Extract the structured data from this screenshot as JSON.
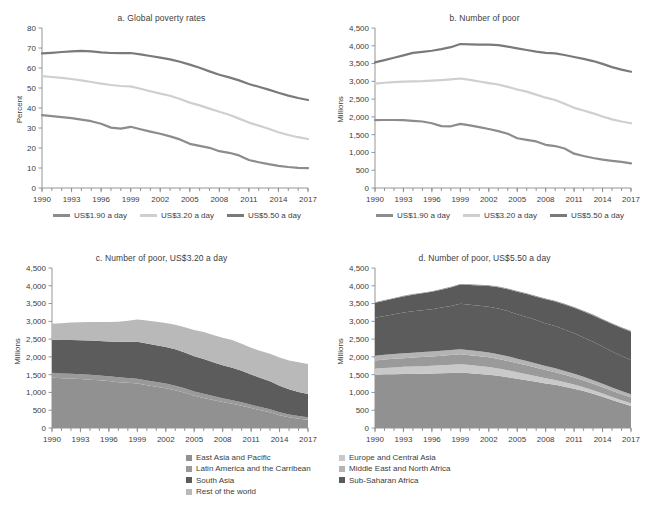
{
  "figure": {
    "panels": [
      "a",
      "b",
      "c",
      "d"
    ]
  },
  "colors": {
    "line_190": "#8c8c8c",
    "line_320": "#cfcfcf",
    "line_550": "#7a7a7a",
    "east_asia_pacific": "#919191",
    "latin_america": "#9a9a9a",
    "south_asia": "#5c5c5c",
    "rest_of_world": "#8e8e8e",
    "europe_central_asia": "#c9c9c9",
    "middle_east_north_africa": "#b4b4b4",
    "sub_saharan_africa": "#5a5a5a",
    "axis": "#8a8a8a",
    "text": "#3d3d3d"
  },
  "panel_a": {
    "title": "a. Global poverty rates",
    "ylabel": "Percent",
    "legend": [
      {
        "label": "US$1.90 a day",
        "color": "#8c8c8c"
      },
      {
        "label": "US$3.20 a day",
        "color": "#cfcfcf"
      },
      {
        "label": "US$5.50 a day",
        "color": "#7a7a7a"
      }
    ]
  },
  "panel_b": {
    "title": "b. Number of poor",
    "ylabel": "Millions",
    "legend": [
      {
        "label": "US$1.90 a day",
        "color": "#8c8c8c"
      },
      {
        "label": "US$3.20 a day",
        "color": "#cfcfcf"
      },
      {
        "label": "US$5.50 a day",
        "color": "#7a7a7a"
      }
    ]
  },
  "panel_c": {
    "title": "c. Number of poor, US$3.20 a day",
    "ylabel": "Millions",
    "legend": [
      {
        "label": "East Asia and Pacific",
        "color": "#919191"
      },
      {
        "label": "Latin America and the Carribean",
        "color": "#9a9a9a"
      },
      {
        "label": "South Asia",
        "color": "#5c5c5c"
      },
      {
        "label": "Rest of the world",
        "color": "#b9b9b9"
      }
    ]
  },
  "panel_d": {
    "title": "d. Number of poor, US$5.50 a day",
    "ylabel": "Millions",
    "legend": [
      {
        "label": "Europe and Central Asia",
        "color": "#c9c9c9"
      },
      {
        "label": "Middle East and North Africa",
        "color": "#b4b4b4"
      },
      {
        "label": "Sub-Saharan Africa",
        "color": "#5a5a5a"
      }
    ]
  },
  "chart_data": [
    {
      "panel": "a",
      "type": "line",
      "title": "a. Global poverty rates",
      "xlabel": "",
      "ylabel": "Percent",
      "ylim": [
        0,
        80
      ],
      "yticks": [
        0,
        10,
        20,
        30,
        40,
        50,
        60,
        70,
        80
      ],
      "xlim": [
        1990,
        2017
      ],
      "xticks": [
        1990,
        1993,
        1996,
        1999,
        2002,
        2005,
        2008,
        2011,
        2014,
        2017
      ],
      "grid": false,
      "legend_position": "below",
      "x": [
        1990,
        1991,
        1992,
        1993,
        1994,
        1995,
        1996,
        1997,
        1998,
        1999,
        2000,
        2001,
        2002,
        2003,
        2004,
        2005,
        2006,
        2007,
        2008,
        2009,
        2010,
        2011,
        2012,
        2013,
        2014,
        2015,
        2016,
        2017
      ],
      "series": [
        {
          "name": "US$1.90 a day",
          "color": "#8c8c8c",
          "values": [
            36.4,
            35.9,
            35.4,
            34.9,
            34.2,
            33.4,
            32.1,
            30.2,
            29.7,
            30.6,
            29.4,
            28.2,
            27.1,
            25.8,
            24.3,
            22.1,
            21.1,
            20.1,
            18.4,
            17.6,
            16.3,
            14.0,
            12.9,
            11.9,
            11.1,
            10.5,
            10.1,
            9.9
          ]
        },
        {
          "name": "US$3.20 a day",
          "color": "#cfcfcf",
          "values": [
            55.9,
            55.5,
            55.1,
            54.5,
            53.8,
            53.0,
            52.2,
            51.5,
            51.0,
            50.8,
            49.6,
            48.4,
            47.2,
            46.1,
            44.5,
            42.7,
            41.3,
            39.7,
            38.1,
            36.6,
            34.7,
            32.7,
            31.2,
            29.6,
            27.9,
            26.5,
            25.4,
            24.5
          ]
        },
        {
          "name": "US$5.50 a day",
          "color": "#7a7a7a",
          "values": [
            67.3,
            67.6,
            68.0,
            68.3,
            68.6,
            68.3,
            67.8,
            67.5,
            67.4,
            67.5,
            66.8,
            66.0,
            65.2,
            64.3,
            63.1,
            61.7,
            60.1,
            58.3,
            56.6,
            55.3,
            53.8,
            52.0,
            50.6,
            49.2,
            47.6,
            46.2,
            45.0,
            44.0
          ]
        }
      ]
    },
    {
      "panel": "b",
      "type": "line",
      "title": "b. Number of poor",
      "xlabel": "",
      "ylabel": "Millions",
      "ylim": [
        0,
        4500
      ],
      "yticks": [
        0,
        500,
        1000,
        1500,
        2000,
        2500,
        3000,
        3500,
        4000,
        4500
      ],
      "ytick_labels": [
        "0",
        "500",
        "1,000",
        "1,500",
        "2,000",
        "2,500",
        "3,000",
        "3,500",
        "4,000",
        "4,500"
      ],
      "xlim": [
        1990,
        2017
      ],
      "xticks": [
        1990,
        1993,
        1996,
        1999,
        2002,
        2005,
        2008,
        2011,
        2014,
        2017
      ],
      "grid": false,
      "legend_position": "below",
      "x": [
        1990,
        1991,
        1992,
        1993,
        1994,
        1995,
        1996,
        1997,
        1998,
        1999,
        2000,
        2001,
        2002,
        2003,
        2004,
        2005,
        2006,
        2007,
        2008,
        2009,
        2010,
        2011,
        2012,
        2013,
        2014,
        2015,
        2016,
        2017
      ],
      "series": [
        {
          "name": "US$1.90 a day",
          "color": "#8c8c8c",
          "values": [
            1911,
            1913,
            1913,
            1910,
            1890,
            1870,
            1820,
            1740,
            1735,
            1805,
            1760,
            1710,
            1660,
            1600,
            1525,
            1400,
            1355,
            1310,
            1215,
            1180,
            1110,
            965,
            900,
            845,
            800,
            765,
            735,
            695
          ]
        },
        {
          "name": "US$3.20 a day",
          "color": "#cfcfcf",
          "values": [
            2935,
            2960,
            2980,
            2990,
            3000,
            3005,
            3020,
            3035,
            3055,
            3080,
            3040,
            2995,
            2950,
            2910,
            2845,
            2770,
            2710,
            2625,
            2540,
            2475,
            2370,
            2255,
            2180,
            2100,
            2010,
            1930,
            1870,
            1820
          ]
        },
        {
          "name": "US$5.50 a day",
          "color": "#7a7a7a",
          "values": [
            3535,
            3595,
            3665,
            3730,
            3800,
            3830,
            3860,
            3905,
            3960,
            4050,
            4040,
            4035,
            4030,
            4020,
            3975,
            3925,
            3880,
            3835,
            3800,
            3785,
            3740,
            3685,
            3630,
            3570,
            3490,
            3400,
            3330,
            3270
          ]
        }
      ]
    },
    {
      "panel": "c",
      "type": "area",
      "stacked": true,
      "title": "c. Number of poor, US$3.20 a day",
      "xlabel": "",
      "ylabel": "Millions",
      "ylim": [
        0,
        4500
      ],
      "yticks": [
        0,
        500,
        1000,
        1500,
        2000,
        2500,
        3000,
        3500,
        4000,
        4500
      ],
      "ytick_labels": [
        "0",
        "500",
        "1,000",
        "1,500",
        "2,000",
        "2,500",
        "3,000",
        "3,500",
        "4,000",
        "4,500"
      ],
      "xlim": [
        1990,
        2017
      ],
      "xticks": [
        1990,
        1993,
        1996,
        1999,
        2002,
        2005,
        2008,
        2011,
        2014,
        2017
      ],
      "grid": false,
      "legend_position": "below",
      "x": [
        1990,
        1991,
        1992,
        1993,
        1994,
        1995,
        1996,
        1997,
        1998,
        1999,
        2000,
        2001,
        2002,
        2003,
        2004,
        2005,
        2006,
        2007,
        2008,
        2009,
        2010,
        2011,
        2012,
        2013,
        2014,
        2015,
        2016,
        2017
      ],
      "series": [
        {
          "name": "East Asia and Pacific",
          "color": "#919191",
          "values": [
            1420,
            1400,
            1390,
            1375,
            1360,
            1345,
            1320,
            1290,
            1270,
            1250,
            1200,
            1160,
            1120,
            1060,
            990,
            905,
            845,
            790,
            730,
            680,
            625,
            560,
            500,
            440,
            360,
            300,
            260,
            230
          ]
        },
        {
          "name": "Latin America and the Carribean",
          "color": "#9a9a9a",
          "values": [
            135,
            135,
            135,
            135,
            135,
            135,
            135,
            135,
            135,
            135,
            135,
            132,
            130,
            128,
            125,
            122,
            118,
            112,
            105,
            102,
            98,
            92,
            88,
            84,
            80,
            78,
            76,
            74
          ]
        },
        {
          "name": "South Asia",
          "color": "#5c5c5c",
          "values": [
            930,
            940,
            950,
            960,
            965,
            970,
            980,
            1000,
            1020,
            1040,
            1040,
            1035,
            1030,
            1025,
            1010,
            990,
            975,
            950,
            930,
            915,
            890,
            855,
            820,
            790,
            750,
            710,
            680,
            650
          ]
        },
        {
          "name": "Rest of the world",
          "color": "#b9b9b9",
          "values": [
            450,
            470,
            490,
            505,
            520,
            530,
            545,
            565,
            590,
            625,
            645,
            660,
            670,
            690,
            710,
            740,
            760,
            765,
            770,
            775,
            760,
            750,
            760,
            775,
            790,
            810,
            830,
            845
          ]
        }
      ]
    },
    {
      "panel": "d",
      "type": "area",
      "stacked": true,
      "title": "d. Number of poor, US$5.50 a day",
      "xlabel": "",
      "ylabel": "Millions",
      "ylim": [
        0,
        4500
      ],
      "yticks": [
        0,
        500,
        1000,
        1500,
        2000,
        2500,
        3000,
        3500,
        4000,
        4500
      ],
      "ytick_labels": [
        "0",
        "500",
        "1,000",
        "1,500",
        "2,000",
        "2,500",
        "3,000",
        "3,500",
        "4,000",
        "4,500"
      ],
      "xlim": [
        1990,
        2017
      ],
      "xticks": [
        1990,
        1993,
        1996,
        1999,
        2002,
        2005,
        2008,
        2011,
        2014,
        2017
      ],
      "grid": false,
      "legend_position": "below",
      "x": [
        1990,
        1991,
        1992,
        1993,
        1994,
        1995,
        1996,
        1997,
        1998,
        1999,
        2000,
        2001,
        2002,
        2003,
        2004,
        2005,
        2006,
        2007,
        2008,
        2009,
        2010,
        2011,
        2012,
        2013,
        2014,
        2015,
        2016,
        2017
      ],
      "series": [
        {
          "name": "East Asia and Pacific",
          "color": "#919191",
          "values": [
            1500,
            1510,
            1515,
            1520,
            1520,
            1525,
            1530,
            1540,
            1550,
            1560,
            1540,
            1520,
            1500,
            1470,
            1430,
            1385,
            1345,
            1300,
            1255,
            1215,
            1160,
            1105,
            1040,
            965,
            880,
            790,
            700,
            620
          ]
        },
        {
          "name": "Europe and Central Asia",
          "color": "#c9c9c9",
          "values": [
            170,
            180,
            190,
            200,
            210,
            215,
            220,
            225,
            230,
            235,
            230,
            222,
            215,
            205,
            195,
            180,
            170,
            158,
            145,
            135,
            125,
            115,
            105,
            95,
            88,
            82,
            78,
            74
          ]
        },
        {
          "name": "Latin America and the Carribean",
          "color": "#9a9a9a",
          "values": [
            230,
            235,
            240,
            245,
            250,
            255,
            260,
            265,
            272,
            280,
            278,
            275,
            272,
            268,
            262,
            255,
            248,
            238,
            228,
            220,
            212,
            202,
            194,
            186,
            180,
            176,
            172,
            168
          ]
        },
        {
          "name": "Middle East and North Africa",
          "color": "#b4b4b4",
          "values": [
            130,
            132,
            134,
            136,
            138,
            139,
            140,
            141,
            142,
            143,
            141,
            139,
            137,
            134,
            131,
            127,
            124,
            120,
            116,
            113,
            109,
            105,
            101,
            97,
            94,
            92,
            90,
            88
          ]
        },
        {
          "name": "South Asia",
          "color": "#5c5c5c",
          "values": [
            1070,
            1095,
            1120,
            1145,
            1165,
            1175,
            1190,
            1215,
            1240,
            1275,
            1280,
            1282,
            1285,
            1282,
            1270,
            1252,
            1238,
            1218,
            1198,
            1185,
            1162,
            1135,
            1105,
            1080,
            1048,
            1015,
            988,
            962
          ]
        },
        {
          "name": "Sub-Saharan Africa",
          "color": "#5a5a5a",
          "values": [
            420,
            430,
            442,
            455,
            468,
            478,
            490,
            505,
            520,
            540,
            555,
            570,
            585,
            600,
            615,
            630,
            645,
            660,
            678,
            692,
            705,
            718,
            730,
            742,
            755,
            768,
            782,
            795
          ]
        },
        {
          "name": "Rest of the world",
          "color": "#8e8e8e",
          "values": [
            15,
            15,
            16,
            16,
            17,
            17,
            18,
            18,
            19,
            19,
            19,
            20,
            20,
            20,
            21,
            21,
            21,
            22,
            22,
            22,
            23,
            23,
            23,
            24,
            24,
            24,
            25,
            25
          ]
        }
      ]
    }
  ]
}
